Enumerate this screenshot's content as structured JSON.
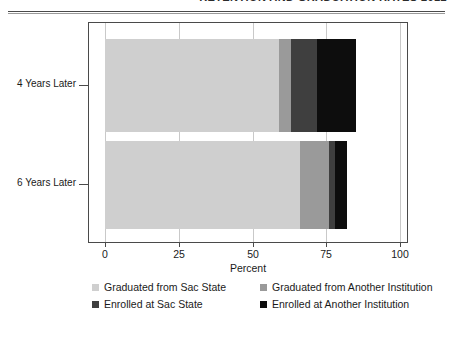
{
  "header": {
    "title": "RETENTION AND GRADUATION RATES 2012"
  },
  "chart_data": {
    "type": "bar",
    "orientation": "horizontal",
    "stacked": true,
    "title": "",
    "xlabel": "Percent",
    "ylabel": "",
    "categories": [
      "4 Years Later",
      "6 Years Later"
    ],
    "xlim": [
      0,
      108
    ],
    "xticks": [
      0,
      25,
      50,
      75,
      100
    ],
    "xticklabels": [
      "0",
      "25",
      "50",
      "75",
      "100"
    ],
    "grid": true,
    "grid_axis": "x",
    "legend_position": "below",
    "series": [
      {
        "name": "Graduated from Sac State",
        "color": "#cfcfcf",
        "values": [
          59,
          66
        ]
      },
      {
        "name": "Graduated from Another Institution",
        "color": "#9a9a9a",
        "values": [
          4,
          10
        ]
      },
      {
        "name": "Enrolled at Sac State",
        "color": "#3f3f3f",
        "values": [
          9,
          2
        ]
      },
      {
        "name": "Enrolled at Another Institution",
        "color": "#0d0d0d",
        "values": [
          13,
          4
        ]
      }
    ],
    "totals": [
      85,
      82
    ]
  },
  "colors": {
    "axis": "#4a4a4a",
    "grid": "#c9c9c9",
    "text": "#1a1a1a",
    "background": "#ffffff"
  }
}
